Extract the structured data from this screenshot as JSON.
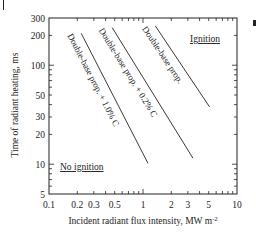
{
  "chart_data": {
    "type": "line",
    "title": "",
    "xlabel": "Incident radiant flux intensity, MW m",
    "xlabel_superscript": "-2",
    "ylabel": "Time of radiant heating, ms",
    "xscale": "log",
    "yscale": "log",
    "xlim": [
      0.1,
      10
    ],
    "ylim": [
      5,
      300
    ],
    "grid": false,
    "legend": "none (inline line labels)",
    "x_ticks": [
      0.1,
      0.2,
      0.3,
      0.5,
      1,
      2,
      3,
      5,
      10
    ],
    "x_tick_labels": [
      "0.1",
      "0.2",
      "0.3",
      "0.5",
      "1",
      "2",
      "3",
      "5",
      "10"
    ],
    "y_ticks": [
      5,
      10,
      20,
      30,
      50,
      100,
      200,
      300
    ],
    "y_tick_labels": [
      "5",
      "10",
      "20",
      "30",
      "50",
      "100",
      "200",
      "300"
    ],
    "series": [
      {
        "name": "Double-base prop. + 1.0% C",
        "x": [
          0.22,
          1.13
        ],
        "y": [
          210,
          10.2
        ]
      },
      {
        "name": "Double-base prop. + 0.2% C",
        "x": [
          0.47,
          3.4
        ],
        "y": [
          240,
          11.5
        ]
      },
      {
        "name": "Double-base prop.",
        "x": [
          1.35,
          5.1
        ],
        "y": [
          250,
          38
        ]
      }
    ],
    "annotations": [
      {
        "text": "Ignition",
        "x": 3.5,
        "y": 220,
        "underline": true
      },
      {
        "text": "No ignition",
        "x": 0.13,
        "y": 9,
        "underline": true
      }
    ]
  },
  "labels": {
    "series_1": "Double-base prop. + 1.0% C",
    "series_2": "Double-base prop. + 0.2% C",
    "series_3": "Double-base prop.",
    "ignition": "Ignition",
    "no_ignition": "No ignition"
  }
}
